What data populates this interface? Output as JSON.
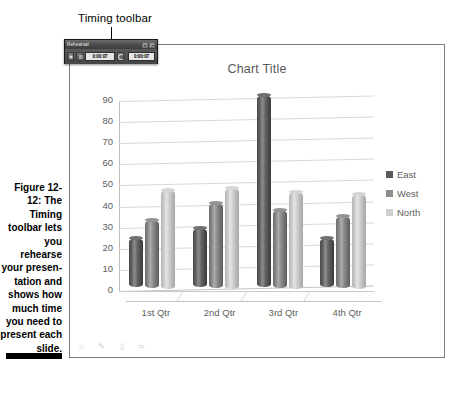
{
  "callout": {
    "label": "Timing toolbar"
  },
  "toolbar": {
    "title": "Rehearsal",
    "dropdown_icon": "chevron-down-icon",
    "close_icon": "close-icon",
    "next_label": "▶",
    "pause_label": "‖",
    "repeat_label": "↺",
    "slide_time": "0:00:07",
    "total_time": "0:00:07"
  },
  "chart_data": {
    "type": "bar",
    "title": "Chart Title",
    "xlabel": "",
    "ylabel": "",
    "ylim": [
      0,
      90
    ],
    "yticks": [
      0,
      10,
      20,
      30,
      40,
      50,
      60,
      70,
      80,
      90
    ],
    "grid": true,
    "legend_position": "right",
    "categories": [
      "1st Qtr",
      "2nd Qtr",
      "3rd Qtr",
      "4th Qtr"
    ],
    "series": [
      {
        "name": "East",
        "color": "#595959",
        "values": [
          23,
          28,
          91,
          23
        ]
      },
      {
        "name": "West",
        "color": "#8c8c8c",
        "values": [
          32,
          40,
          37,
          34
        ]
      },
      {
        "name": "North",
        "color": "#d0d0d0",
        "values": [
          47,
          48,
          46,
          45
        ]
      }
    ]
  },
  "status_icons": [
    "sun-icon",
    "pencil-icon",
    "slides-icon",
    "arrow-icon"
  ],
  "caption": {
    "figure_number": "Figure 12-12:",
    "text": "The Timing toolbar lets you rehearse your presen-tation and shows how much time you need to present each slide."
  }
}
